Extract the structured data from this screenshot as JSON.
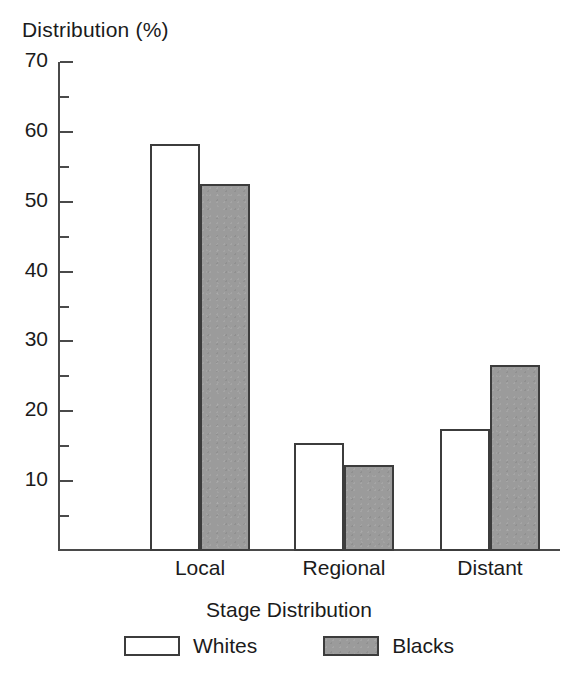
{
  "chart_data": {
    "type": "bar",
    "title": "",
    "ylabel": "Distribution (%)",
    "xlabel": "Stage Distribution",
    "categories": [
      "Local",
      "Regional",
      "Distant"
    ],
    "series": [
      {
        "name": "Whites",
        "color": "#ffffff",
        "values": [
          58.3,
          15.5,
          17.5
        ]
      },
      {
        "name": "Blacks",
        "color": "#9b9b9b",
        "values": [
          52.6,
          12.3,
          26.6
        ]
      }
    ],
    "ylim": [
      0,
      70
    ],
    "y_major_ticks": [
      70,
      60,
      50,
      40,
      30,
      20,
      10
    ],
    "y_minor_ticks": [
      65,
      55,
      45,
      35,
      25,
      15,
      5
    ],
    "y_tick_labels": [
      "70",
      "60",
      "50",
      "40",
      "30",
      "20",
      "10"
    ],
    "grid": false,
    "legend_position": "bottom",
    "bar_outline_color": "#3c3c3c",
    "axis_color": "#4a4a4a"
  },
  "legend": {
    "items": [
      {
        "label": "Whites"
      },
      {
        "label": "Blacks"
      }
    ]
  }
}
